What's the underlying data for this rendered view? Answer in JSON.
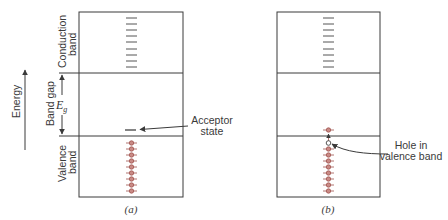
{
  "axis": {
    "energy_label": "Energy"
  },
  "bands": {
    "conduction_label_1": "Conduction",
    "conduction_label_2": "band",
    "gap_label": "Band gap",
    "gap_symbol": "E",
    "gap_subscript": "g",
    "valence_label_1": "Valence",
    "valence_label_2": "band"
  },
  "panel_a": {
    "caption": "(a)",
    "annotation_line1": "Acceptor",
    "annotation_line2": "state"
  },
  "panel_b": {
    "caption": "(b)",
    "annotation_line1": "Hole in",
    "annotation_line2": "valence band"
  },
  "colors": {
    "line": "#3a3a3a",
    "electron_fill": "#c98a85",
    "electron_stroke": "#a0524d"
  }
}
